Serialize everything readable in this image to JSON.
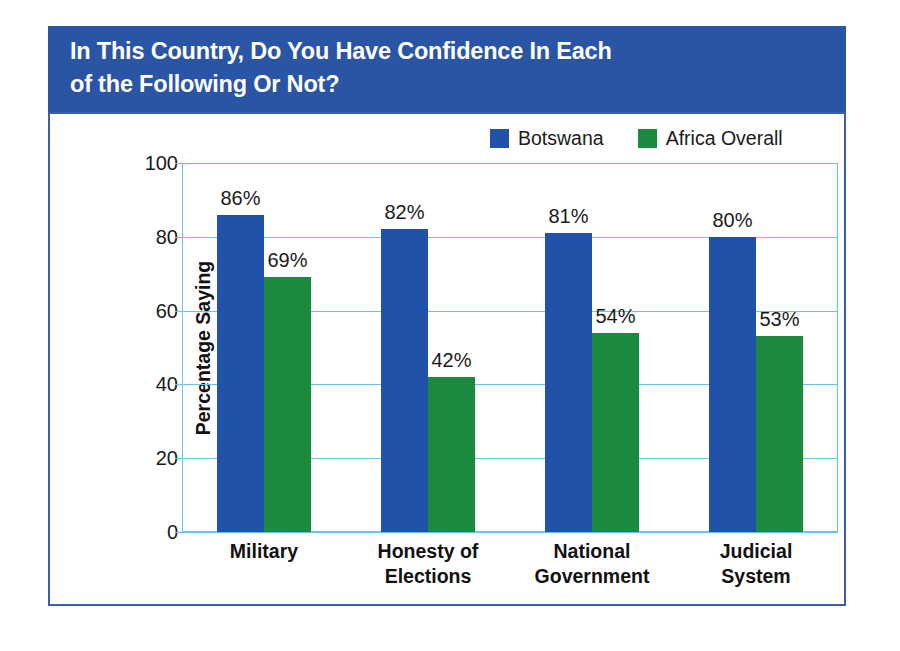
{
  "header": {
    "title": "In This Country, Do You Have Confidence In Each\nof the Following Or Not?",
    "background_color": "#2a55a5",
    "text_color": "#ffffff"
  },
  "panel": {
    "border_color": "#3a5fae",
    "background_color": "#ffffff"
  },
  "legend": {
    "position": "top-right",
    "entries": [
      {
        "label": "Botswana",
        "color": "#1f52a8"
      },
      {
        "label": "Africa Overall",
        "color": "#1c8a3e"
      }
    ]
  },
  "axes": {
    "y_label": "Percentage Saying\n“Yes, Have Confidence”",
    "y_ticks": [
      "0",
      "20",
      "40",
      "60",
      "80",
      "100"
    ],
    "gridline_color": "#63c6ea"
  },
  "chart_data": {
    "type": "bar",
    "title": "In This Country, Do You Have Confidence In Each of the Following Or Not?",
    "xlabel": "",
    "ylabel": "Percentage Saying “Yes, Have Confidence”",
    "ylim": [
      0,
      100
    ],
    "yticks": [
      0,
      20,
      40,
      60,
      80,
      100
    ],
    "grid": true,
    "legend_position": "top-right",
    "categories": [
      "Military",
      "Honesty of\nElections",
      "National\nGovernment",
      "Judicial\nSystem"
    ],
    "series": [
      {
        "name": "Botswana",
        "color": "#1f52a8",
        "values": [
          86,
          82,
          81,
          80
        ],
        "labels": [
          "86%",
          "82%",
          "81%",
          "80%"
        ]
      },
      {
        "name": "Africa Overall",
        "color": "#1c8a3e",
        "values": [
          69,
          42,
          54,
          53
        ],
        "labels": [
          "69%",
          "42%",
          "54%",
          "53%"
        ]
      }
    ]
  }
}
